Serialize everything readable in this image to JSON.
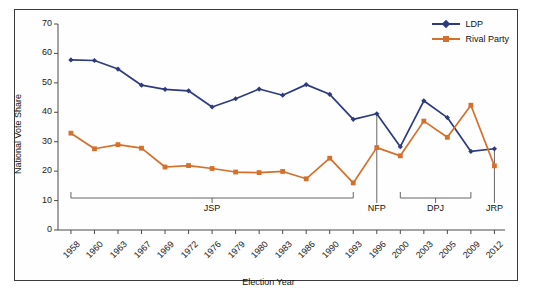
{
  "chart_data": {
    "type": "line",
    "title": "",
    "xlabel": "Election Year",
    "ylabel": "National Vote Share",
    "ylim": [
      0,
      70
    ],
    "yticks": [
      0,
      10,
      20,
      30,
      40,
      50,
      60,
      70
    ],
    "grid": false,
    "legend_position": "top-right",
    "categories": [
      "1958",
      "1960",
      "1963",
      "1967",
      "1969",
      "1972",
      "1976",
      "1979",
      "1980",
      "1983",
      "1986",
      "1990",
      "1993",
      "1996",
      "2000",
      "2003",
      "2005",
      "2009",
      "2012"
    ],
    "series": [
      {
        "name": "LDP",
        "color": "#2e3a80",
        "marker": "diamond",
        "values": [
          57.8,
          57.6,
          54.7,
          49.2,
          47.8,
          47.3,
          41.8,
          44.6,
          47.9,
          45.8,
          49.4,
          46.1,
          37.6,
          39.5,
          28.3,
          43.9,
          38.2,
          26.7,
          27.6
        ]
      },
      {
        "name": "Rival Party",
        "color": "#d4702a",
        "marker": "square",
        "values": [
          32.9,
          27.6,
          29.0,
          27.8,
          21.4,
          21.9,
          20.9,
          19.7,
          19.5,
          19.9,
          17.4,
          24.4,
          16.0,
          28.0,
          25.2,
          37.0,
          31.5,
          42.4,
          21.8
        ]
      }
    ],
    "annotations": [
      {
        "label": "JSP",
        "type": "bracket",
        "from": "1958",
        "to": "1993"
      },
      {
        "label": "NFP",
        "type": "line",
        "at": "1996"
      },
      {
        "label": "DPJ",
        "type": "bracket",
        "from": "2000",
        "to": "2009"
      },
      {
        "label": "JRP",
        "type": "line",
        "at": "2012"
      }
    ]
  },
  "legend": {
    "items": [
      {
        "label": "LDP"
      },
      {
        "label": "Rival Party"
      }
    ]
  },
  "axes": {
    "y_title": "National Vote Share",
    "x_title": "Election Year"
  }
}
